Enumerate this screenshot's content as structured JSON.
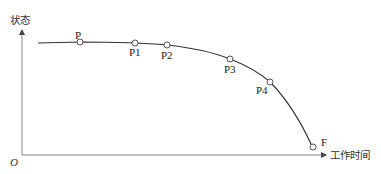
{
  "diagram": {
    "y_axis_label": "状态",
    "x_axis_label": "工作时间",
    "origin_label": "O",
    "points": [
      {
        "id": "P",
        "label": "P"
      },
      {
        "id": "P1",
        "label": "P1"
      },
      {
        "id": "P2",
        "label": "P2"
      },
      {
        "id": "P3",
        "label": "P3"
      },
      {
        "id": "P4",
        "label": "P4"
      },
      {
        "id": "F",
        "label": "F"
      }
    ],
    "colors": {
      "line": "#333333",
      "axis": "#777777",
      "marker_fill": "#ffffff"
    }
  }
}
